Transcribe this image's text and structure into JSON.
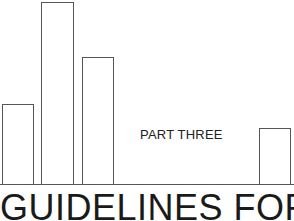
{
  "page": {
    "section_label": "PART THREE",
    "heading": "GUIDELINES FOR"
  },
  "decoration": {
    "bars": [
      {
        "left": 2,
        "top": 104,
        "width": 32,
        "height": 81
      },
      {
        "left": 41,
        "top": 2,
        "width": 33,
        "height": 183
      },
      {
        "left": 82,
        "top": 57,
        "width": 32,
        "height": 128
      },
      {
        "left": 259,
        "top": 128,
        "width": 32,
        "height": 57
      }
    ],
    "line_color": "#555555"
  }
}
